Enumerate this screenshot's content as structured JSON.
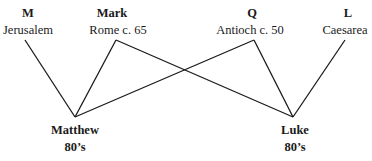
{
  "sources": [
    {
      "id": "M",
      "letter": "M",
      "place": "Jerusalem"
    },
    {
      "id": "Mark",
      "letter": "Mark",
      "place": "Rome c. 65"
    },
    {
      "id": "Q",
      "letter": "Q",
      "place": "Antioch c. 50"
    },
    {
      "id": "L",
      "letter": "L",
      "place": "Caesarea"
    }
  ],
  "gospels": [
    {
      "id": "Matthew",
      "name": "Matthew",
      "date": "80’s"
    },
    {
      "id": "Luke",
      "name": "Luke",
      "date": "80’s"
    }
  ],
  "edges": [
    {
      "from": "M",
      "to": "Matthew"
    },
    {
      "from": "Mark",
      "to": "Matthew"
    },
    {
      "from": "Mark",
      "to": "Luke"
    },
    {
      "from": "Q",
      "to": "Matthew"
    },
    {
      "from": "Q",
      "to": "Luke"
    },
    {
      "from": "L",
      "to": "Luke"
    }
  ],
  "colors": {
    "line": "#1a1a1a",
    "text": "#1a1a1a",
    "background": "#ffffff"
  }
}
